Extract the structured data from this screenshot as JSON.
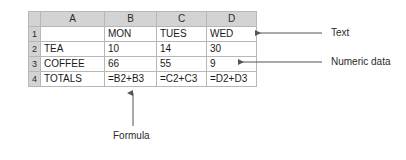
{
  "spreadsheet": {
    "corner_label": "",
    "column_headers": [
      "A",
      "B",
      "C",
      "D"
    ],
    "row_headers": [
      "1",
      "2",
      "3",
      "4"
    ],
    "rows": [
      {
        "row_number": "1",
        "cells": [
          "",
          "MON",
          "TUES",
          "WED"
        ]
      },
      {
        "row_number": "2",
        "cells": [
          "TEA",
          "10",
          "14",
          "30"
        ]
      },
      {
        "row_number": "3",
        "cells": [
          "COFFEE",
          "66",
          "55",
          "9"
        ]
      },
      {
        "row_number": "4",
        "cells": [
          "TOTALS",
          "=B2+B3",
          "=C2+C3",
          "=D2+D3"
        ]
      }
    ],
    "header_bg": "#d3d3d3",
    "grid_line_color": "#b7b7b7",
    "cell_bg": "#ffffff",
    "text_color": "#1a1a1a"
  },
  "annotations": {
    "text_label": "Text",
    "numeric_label": "Numeric data",
    "formula_label": "Formula",
    "arrow_color": "#555555"
  }
}
